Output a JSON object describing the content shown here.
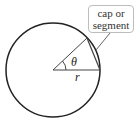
{
  "diagram": {
    "callout_line1": "cap or",
    "callout_line2": "segment",
    "angle_label": "θ",
    "radius_label": "r"
  }
}
